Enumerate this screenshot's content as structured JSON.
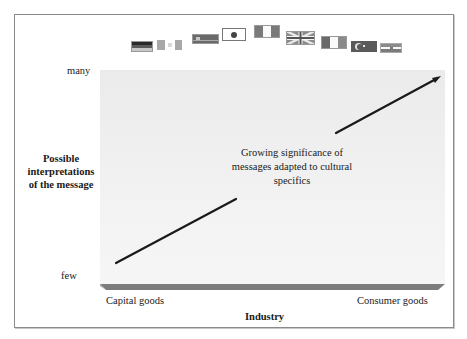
{
  "diagram": {
    "y_axis": {
      "title_lines": [
        "Possible",
        "interpretations",
        "of the message"
      ],
      "top_label": "many",
      "bottom_label": "few"
    },
    "x_axis": {
      "title": "Industry",
      "left_label": "Capital goods",
      "right_label": "Consumer goods"
    },
    "annotation_lines": [
      "Growing significance of",
      "messages adapted to cultural",
      "specifics"
    ],
    "trend_arrow": {
      "direction": "up-right",
      "from": "few / Capital goods",
      "to": "many / Consumer goods"
    },
    "flags": [
      {
        "name": "germany-flag"
      },
      {
        "name": "canada-flag"
      },
      {
        "name": "china-flag"
      },
      {
        "name": "japan-flag"
      },
      {
        "name": "italy-flag"
      },
      {
        "name": "uk-flag"
      },
      {
        "name": "france-flag"
      },
      {
        "name": "turkey-flag"
      },
      {
        "name": "iran-flag"
      }
    ],
    "colors": {
      "panel": "#efefef",
      "floor": "#7a7a7a",
      "arrow": "#1a1a1a",
      "frame": "#8a8a8a"
    }
  }
}
